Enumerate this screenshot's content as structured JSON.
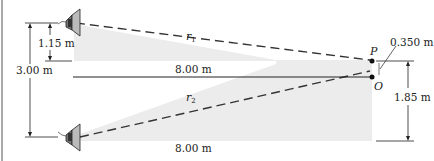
{
  "figure": {
    "labels": {
      "height_upper_speaker": "1.15 m",
      "speaker_separation": "3.00 m",
      "horizontal_distance_top": "8.00 m",
      "horizontal_distance_bottom": "8.00 m",
      "offset_P": "0.350 m",
      "height_from_bottom": "1.85 m",
      "path1": "r",
      "path1_sub": "1",
      "path2": "r",
      "path2_sub": "2",
      "point_P": "P",
      "point_O": "O"
    },
    "colors": {
      "line": "#222222",
      "shade": "#ececec",
      "dash": "#333333"
    }
  }
}
